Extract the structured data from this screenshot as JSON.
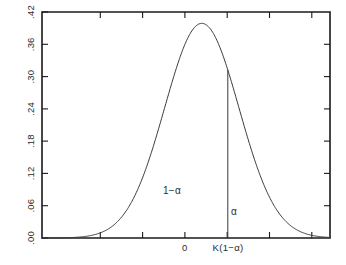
{
  "chart_data": {
    "type": "line",
    "title": "",
    "subtitle": "",
    "xlabel": "",
    "ylabel": "",
    "grid": false,
    "legend": null,
    "xlim": [
      -4.3,
      3.45
    ],
    "ylim": [
      0.0,
      0.42
    ],
    "y_ticks": [
      ".42",
      ".36",
      ".30",
      ".24",
      ".18",
      ".12",
      ".06",
      ".00"
    ],
    "y_tick_values": [
      0.42,
      0.36,
      0.3,
      0.24,
      0.18,
      0.12,
      0.06,
      0.0
    ],
    "x_tick_values": [
      -3,
      -2,
      -1,
      0,
      1,
      2
    ],
    "x_tick_labels": [
      "",
      "",
      "",
      "0",
      "",
      ""
    ],
    "curve": {
      "name": "normal-density",
      "peak_x": 0,
      "peak_y": 0.3989,
      "mean": 0,
      "sd": 1
    },
    "critical_value": {
      "x": 0.7,
      "y": 0.2323,
      "label": "K(1−α)"
    },
    "annotations": [
      {
        "name": "left-area",
        "text": "1−α",
        "x": -0.9,
        "y": 0.085
      },
      {
        "name": "right-area",
        "text": "α",
        "x": 1.2,
        "y": 0.048
      },
      {
        "name": "origin",
        "text": "0",
        "x": 0,
        "y": 0
      }
    ],
    "axis_color": "#1a1a1a",
    "curve_color": "#3a3a3a",
    "background_color": "#ffffff"
  },
  "labels": {
    "y_42": ".42",
    "y_36": ".36",
    "y_30": ".30",
    "y_24": ".24",
    "y_18": ".18",
    "y_12": ".12",
    "y_06": ".06",
    "y_00": ".00",
    "x_origin": "0",
    "x_critical": "K(1−α)",
    "region_left": "1−α",
    "region_right": "α"
  }
}
